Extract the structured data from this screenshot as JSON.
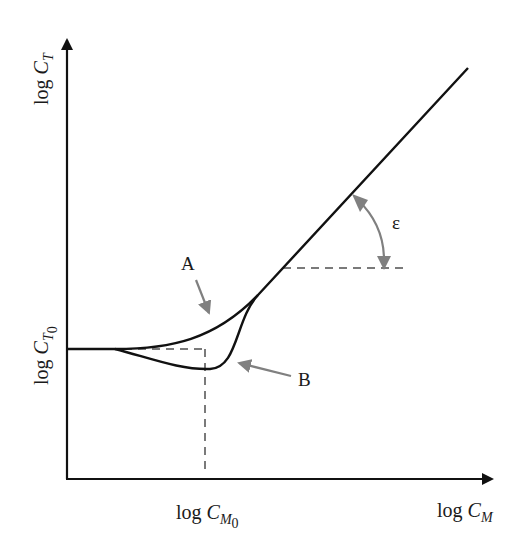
{
  "diagram": {
    "type": "schematic plot",
    "axes": {
      "x": {
        "label_prefix": "log ",
        "label_var": "C",
        "label_sub": "M"
      },
      "y": {
        "label_prefix": "log ",
        "label_var": "C",
        "label_sub": "T"
      }
    },
    "reference_marks": {
      "x0": {
        "label_prefix": "log ",
        "label_var": "C",
        "label_sub": "M",
        "label_subsub": "0"
      },
      "y0": {
        "label_prefix": "log ",
        "label_var": "C",
        "label_sub": "T",
        "label_subsub": "0"
      }
    },
    "curves": [
      {
        "id": "A",
        "label": "A",
        "description": "monotonic rising curve joining linear asymptote"
      },
      {
        "id": "B",
        "label": "B",
        "description": "curve with minimum near log CM0 before joining linear asymptote"
      }
    ],
    "angle": {
      "symbol": "ε",
      "description": "slope angle of linear asymptote"
    },
    "colors": {
      "line": "#111111",
      "annotation": "#808080",
      "dashed": "#7a7a7a"
    }
  }
}
